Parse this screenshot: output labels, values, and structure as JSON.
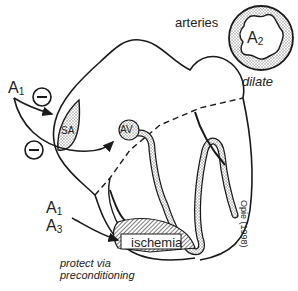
{
  "diagram": {
    "labels": {
      "a1_top": {
        "main": "A",
        "sub": "1"
      },
      "a1_bottom": {
        "main": "A",
        "sub": "1"
      },
      "a3": {
        "main": "A",
        "sub": "3"
      },
      "a2": {
        "main": "A",
        "sub": "2"
      },
      "sa_node": "SA",
      "av_node": "AV",
      "arteries": "arteries",
      "dilate": "dilate",
      "ischemia": "ischemia",
      "protect_line1": "protect via",
      "protect_line2": "preconditioning",
      "citation": "Opie (1998)",
      "inhibit_symbol": "−"
    },
    "colors": {
      "stroke": "#1a1a1a",
      "stipple": "#c8c8c8",
      "hatch": "#555555",
      "background": "#ffffff"
    }
  }
}
